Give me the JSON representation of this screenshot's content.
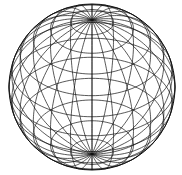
{
  "figure": {
    "type": "wireframe-sphere",
    "width": 182,
    "height": 175,
    "background": "#ffffff",
    "stroke_color": "#111111",
    "stroke_width": 0.7,
    "center": [
      92,
      87
    ],
    "radius": 83,
    "tilt_degrees": 36,
    "meridians": 24,
    "parallels": 11
  }
}
